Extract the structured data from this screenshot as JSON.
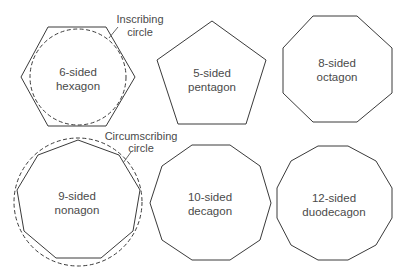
{
  "diagram": {
    "shapes": [
      {
        "id": "hexagon",
        "line1": "6-sided",
        "line2": "hexagon",
        "sides": 6
      },
      {
        "id": "pentagon",
        "line1": "5-sided",
        "line2": "pentagon",
        "sides": 5
      },
      {
        "id": "octagon",
        "line1": "8-sided",
        "line2": "octagon",
        "sides": 8
      },
      {
        "id": "nonagon",
        "line1": "9-sided",
        "line2": "nonagon",
        "sides": 9
      },
      {
        "id": "decagon",
        "line1": "10-sided",
        "line2": "decagon",
        "sides": 10
      },
      {
        "id": "dodecagon",
        "line1": "12-sided",
        "line2": "duodecagon",
        "sides": 12
      }
    ],
    "callouts": {
      "inscribing": {
        "line1": "Inscribing",
        "line2": "circle"
      },
      "circumscribing": {
        "line1": "Circumscribing",
        "line2": "circle"
      }
    },
    "colors": {
      "stroke": "#3a3a3a",
      "text": "#4a4a4a",
      "background": "#ffffff"
    }
  }
}
